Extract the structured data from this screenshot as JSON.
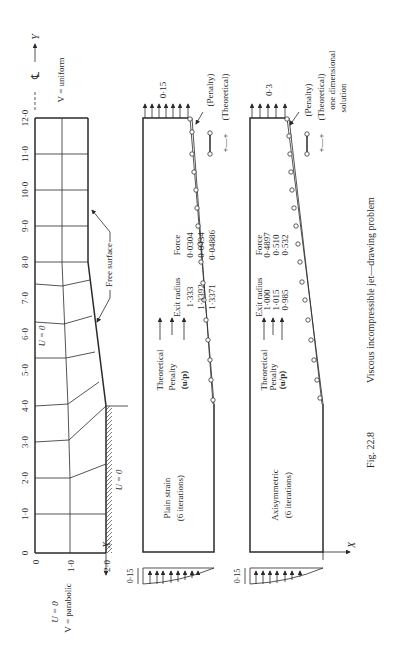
{
  "figure": {
    "caption_label": "Fig. 22.8",
    "caption_text": "Viscous incompressible jet—drawing problem",
    "orientation": "rotated 90 degrees counter-clockwise"
  },
  "mesh_panel": {
    "y_axis_label": "Y",
    "x_axis_label": "X",
    "centerline_symbol": "℄",
    "top_bc": "V = uniform",
    "inlet_bc_u": "U = 0",
    "inlet_bc_v": "V = parabolic",
    "centerline_bc": "U = 0",
    "wall_bc": "U = 0",
    "free_surface_label": "Free surface",
    "y_ticks": [
      "0",
      "1·0",
      "2·0",
      "3·0",
      "4·0",
      "5·0",
      "6·0",
      "7·0",
      "8·0",
      "9·0",
      "10·0",
      "11·0",
      "12·0"
    ],
    "x_ticks": [
      "0",
      "1·0",
      "2·0"
    ]
  },
  "plain_strain_panel": {
    "title": "Plain strain",
    "subtitle": "(6 iterations)",
    "exit_velocity_label": "0·15",
    "inlet_profile_label": "0·15",
    "legend": {
      "penalty": "(Penalty)",
      "theoretical": "(Theoretical)"
    },
    "table": {
      "headers": [
        "",
        "Exit radius",
        "Force"
      ],
      "rows": [
        {
          "method": "Theoretical",
          "exit_radius": "1·333",
          "force": "0·0304"
        },
        {
          "method": "Penalty",
          "exit_radius": "1·3392",
          "force": "0·0434"
        },
        {
          "method": "(u/p)",
          "exit_radius": "1·3371",
          "force": "0·04886"
        }
      ]
    }
  },
  "axisymmetric_panel": {
    "title": "Axisymmetric",
    "subtitle": "(6 iterations)",
    "exit_velocity_label": "0·3",
    "inlet_profile_label": "0·15",
    "x_axis_label": "X",
    "legend": {
      "penalty": "(Penalty)",
      "theoretical": "(Theoretical)",
      "theoretical_note_1": "one dimensional",
      "theoretical_note_2": "solution"
    },
    "table": {
      "headers": [
        "",
        "Exit radius",
        "Force"
      ],
      "rows": [
        {
          "method": "Theoretical",
          "exit_radius": "1·000",
          "force": "0·4897"
        },
        {
          "method": "Penalty",
          "exit_radius": "1·015",
          "force": "0·510"
        },
        {
          "method": "(u/p)",
          "exit_radius": "0·985",
          "force": "0·532"
        }
      ]
    }
  }
}
